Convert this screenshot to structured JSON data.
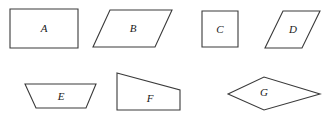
{
  "figure": {
    "background_color": "#ffffff",
    "stroke_color": "#3a3a3a",
    "label_color": "#1a1a1a",
    "width": 330,
    "height": 118,
    "row_count": 2,
    "shape_count": 7
  },
  "shapes": [
    {
      "label": "A",
      "kind": "rectangle",
      "row": 1,
      "points": "10,9 78,9 78,48 10,48",
      "label_x": 44,
      "label_y": 29
    },
    {
      "label": "B",
      "kind": "parallelogram",
      "row": 1,
      "points": "110,10 172,10 155,47 93,47",
      "label_x": 133,
      "label_y": 29
    },
    {
      "label": "C",
      "kind": "square",
      "row": 1,
      "points": "202,11 238,11 238,47 202,47",
      "label_x": 220,
      "label_y": 30
    },
    {
      "label": "D",
      "kind": "parallelogram",
      "row": 1,
      "points": "283,11 320,11 302,48 265,48",
      "label_x": 293,
      "label_y": 30
    },
    {
      "label": "E",
      "kind": "trapezoid",
      "row": 2,
      "points": "25,84 96,84 86,108 36,108",
      "label_x": 61,
      "label_y": 97
    },
    {
      "label": "F",
      "kind": "trapezoid",
      "row": 2,
      "points": "117,73 180,90 180,110 117,110",
      "label_x": 150,
      "label_y": 98
    },
    {
      "label": "G",
      "kind": "rhombus",
      "row": 2,
      "points": "228,94 264,77 320,94 264,110",
      "label_x": 264,
      "label_y": 93
    }
  ]
}
